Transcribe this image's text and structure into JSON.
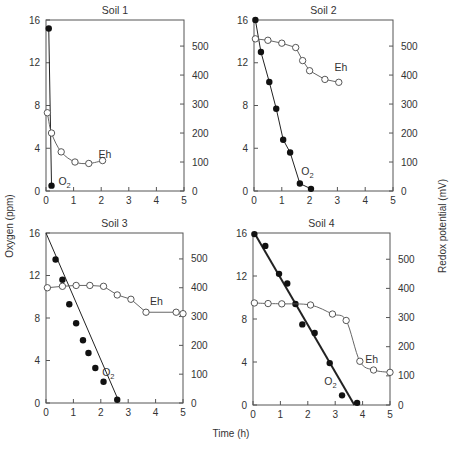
{
  "figure": {
    "ylabel_left": "Oxygen (ppm)",
    "ylabel_right": "Redox potential (mV)",
    "xlabel": "Time (h)"
  },
  "chart_data": [
    {
      "type": "line",
      "title": "Soil 1",
      "xlabel": "Time (h)",
      "ylabel": "Oxygen (ppm)",
      "ylabel_right": "Redox potential (mV)",
      "xlim": [
        0,
        5
      ],
      "ylim": [
        0,
        16
      ],
      "ylim_right": [
        0,
        590
      ],
      "xticks": [
        0,
        1,
        2,
        3,
        4,
        5
      ],
      "yticks": [
        0,
        4,
        8,
        12,
        16
      ],
      "yticks_right": [
        0,
        100,
        200,
        300,
        400,
        500
      ],
      "series": [
        {
          "name": "O2",
          "axis": "left",
          "marker": "filled-circle",
          "fit": "connect",
          "x": [
            0.1,
            0.2
          ],
          "y": [
            15.2,
            0.5
          ]
        },
        {
          "name": "Eh",
          "axis": "right",
          "marker": "open-circle",
          "fit": "smooth",
          "x": [
            0.05,
            0.2,
            0.55,
            1.05,
            1.55,
            2.05
          ],
          "y": [
            270,
            200,
            135,
            100,
            95,
            105
          ]
        }
      ]
    },
    {
      "type": "line",
      "title": "Soil 2",
      "xlabel": "Time (h)",
      "ylabel": "Oxygen (ppm)",
      "ylabel_right": "Redox potential (mV)",
      "xlim": [
        0,
        5
      ],
      "ylim": [
        0,
        16
      ],
      "ylim_right": [
        0,
        590
      ],
      "xticks": [
        0,
        1,
        2,
        3,
        4,
        5
      ],
      "yticks": [
        0,
        4,
        8,
        12,
        16
      ],
      "yticks_right": [
        0,
        100,
        200,
        300,
        400,
        500
      ],
      "series": [
        {
          "name": "O2",
          "axis": "left",
          "marker": "filled-circle",
          "fit": "connect",
          "x": [
            0.05,
            0.25,
            0.55,
            0.8,
            1.05,
            1.3,
            1.65,
            2.05
          ],
          "y": [
            16.0,
            13.0,
            10.2,
            7.7,
            4.8,
            3.6,
            0.7,
            0.2
          ]
        },
        {
          "name": "Eh",
          "axis": "right",
          "marker": "open-circle",
          "fit": "connect",
          "x": [
            0.05,
            0.5,
            1.0,
            1.5,
            1.75,
            2.0,
            2.55,
            3.05
          ],
          "y": [
            525,
            520,
            510,
            495,
            450,
            415,
            385,
            375
          ]
        }
      ]
    },
    {
      "type": "line",
      "title": "Soil 3",
      "xlabel": "Time (h)",
      "ylabel": "Oxygen (ppm)",
      "ylabel_right": "Redox potential (mV)",
      "xlim": [
        0,
        5
      ],
      "ylim": [
        0,
        16
      ],
      "ylim_right": [
        0,
        590
      ],
      "xticks": [
        0,
        1,
        2,
        3,
        4,
        5
      ],
      "yticks": [
        0,
        4,
        8,
        12,
        16
      ],
      "yticks_right": [
        0,
        100,
        200,
        300,
        400,
        500
      ],
      "series": [
        {
          "name": "O2",
          "axis": "left",
          "marker": "filled-circle",
          "fit": "linear",
          "fit_line": {
            "x": [
              0.0,
              2.65
            ],
            "y": [
              16.0,
              0.2
            ]
          },
          "x": [
            0.35,
            0.6,
            0.85,
            1.1,
            1.35,
            1.55,
            1.8,
            2.1,
            2.6
          ],
          "y": [
            13.5,
            11.6,
            9.3,
            7.5,
            5.9,
            4.7,
            3.3,
            2.0,
            0.3
          ]
        },
        {
          "name": "Eh",
          "axis": "right",
          "marker": "open-circle",
          "fit": "connect",
          "x": [
            0.05,
            0.6,
            1.1,
            1.6,
            2.1,
            2.6,
            3.1,
            3.65,
            4.75,
            5.0
          ],
          "y": [
            400,
            405,
            408,
            408,
            405,
            375,
            360,
            315,
            315,
            310
          ]
        }
      ]
    },
    {
      "type": "line",
      "title": "Soil 4",
      "xlabel": "Time (h)",
      "ylabel": "Oxygen (ppm)",
      "ylabel_right": "Redox potential (mV)",
      "xlim": [
        0,
        5
      ],
      "ylim": [
        0,
        16
      ],
      "ylim_right": [
        0,
        590
      ],
      "xticks": [
        0,
        1,
        2,
        3,
        4,
        5
      ],
      "yticks": [
        0,
        4,
        8,
        12,
        16
      ],
      "yticks_right": [
        0,
        100,
        200,
        300,
        400,
        500
      ],
      "series": [
        {
          "name": "O2",
          "axis": "left",
          "marker": "filled-circle",
          "fit": "linear",
          "bold": true,
          "fit_line": {
            "x": [
              0.05,
              3.7
            ],
            "y": [
              16.0,
              0.0
            ]
          },
          "x": [
            0.05,
            0.45,
            0.95,
            1.25,
            1.55,
            1.8,
            2.25,
            2.8,
            3.25,
            3.8
          ],
          "y": [
            15.9,
            14.8,
            12.2,
            11.3,
            9.4,
            7.5,
            6.7,
            3.9,
            0.9,
            0.2
          ]
        },
        {
          "name": "Eh",
          "axis": "right",
          "marker": "open-circle",
          "fit": "smooth",
          "x": [
            0.05,
            0.55,
            1.05,
            2.1,
            2.9,
            3.4,
            3.9,
            4.4,
            5.0
          ],
          "y": [
            350,
            348,
            347,
            343,
            312,
            290,
            150,
            120,
            112
          ]
        }
      ]
    }
  ],
  "panels_layout": [
    {
      "left": 46,
      "top": 20,
      "right": 184,
      "bottom": 191,
      "o2_label": {
        "x": 0.45,
        "y": 0.6
      },
      "eh_label": {
        "x": 1.9,
        "y": 115
      }
    },
    {
      "left": 254,
      "top": 20,
      "right": 393,
      "bottom": 191,
      "o2_label": {
        "x": 1.7,
        "y": 1.5
      },
      "eh_label": {
        "x": 2.9,
        "y": 415
      }
    },
    {
      "left": 46,
      "top": 233,
      "right": 183,
      "bottom": 403,
      "o2_label": {
        "x": 2.05,
        "y": 2.5
      },
      "eh_label": {
        "x": 3.8,
        "y": 340
      }
    },
    {
      "left": 253,
      "top": 233,
      "right": 390,
      "bottom": 405,
      "o2_label": {
        "x": 2.6,
        "y": 1.9
      },
      "eh_label": {
        "x": 4.1,
        "y": 145
      }
    }
  ]
}
